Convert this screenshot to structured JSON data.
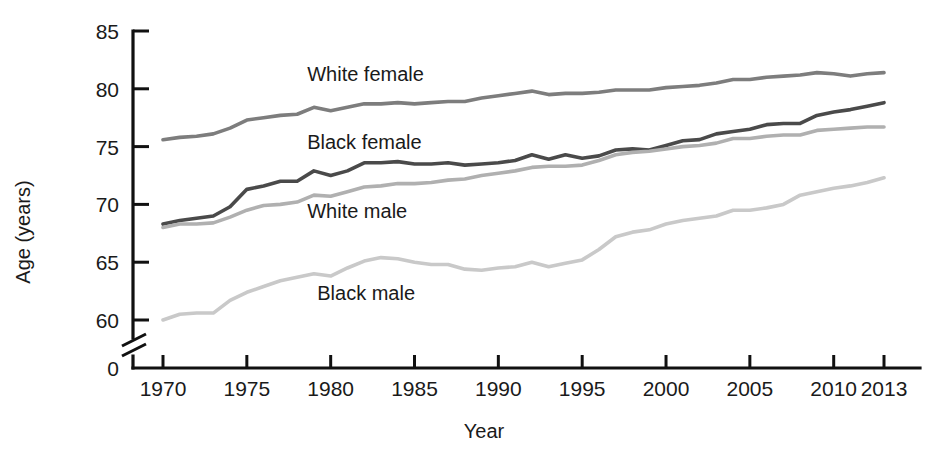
{
  "chart_data": {
    "type": "line",
    "title": "",
    "xlabel": "Year",
    "ylabel": "Age (years)",
    "xlim": [
      1968.5,
      2014.5
    ],
    "ylim": [
      59.0,
      85.0
    ],
    "y_axis_break": true,
    "y_break_from": 0,
    "y_break_to": 59,
    "grid": false,
    "legend": "inline-labels",
    "x_ticks": [
      "1970",
      "1975",
      "1980",
      "1985",
      "1990",
      "1995",
      "2000",
      "2005",
      "2010",
      "2013"
    ],
    "x_tick_values": [
      1970,
      1975,
      1980,
      1985,
      1990,
      1995,
      2000,
      2005,
      2010,
      2013
    ],
    "y_ticks": [
      "0",
      "60",
      "65",
      "70",
      "75",
      "80",
      "85"
    ],
    "y_tick_values": [
      0,
      60,
      65,
      70,
      75,
      80,
      85
    ],
    "x": [
      1970,
      1971,
      1972,
      1973,
      1974,
      1975,
      1976,
      1977,
      1978,
      1979,
      1980,
      1981,
      1982,
      1983,
      1984,
      1985,
      1986,
      1987,
      1988,
      1989,
      1990,
      1991,
      1992,
      1993,
      1994,
      1995,
      1996,
      1997,
      1998,
      1999,
      2000,
      2001,
      2002,
      2003,
      2004,
      2005,
      2006,
      2007,
      2008,
      2009,
      2010,
      2011,
      2012,
      2013
    ],
    "series": [
      {
        "name": "White female",
        "color": "#7d7d7d",
        "label": "White female",
        "values": [
          75.6,
          75.8,
          75.9,
          76.1,
          76.6,
          77.3,
          77.5,
          77.7,
          77.8,
          78.4,
          78.1,
          78.4,
          78.7,
          78.7,
          78.8,
          78.7,
          78.8,
          78.9,
          78.9,
          79.2,
          79.4,
          79.6,
          79.8,
          79.5,
          79.6,
          79.6,
          79.7,
          79.9,
          79.9,
          79.9,
          80.1,
          80.2,
          80.3,
          80.5,
          80.8,
          80.8,
          81.0,
          81.1,
          81.2,
          81.4,
          81.3,
          81.1,
          81.3,
          81.4
        ]
      },
      {
        "name": "Black female",
        "color": "#4a4a4a",
        "label": "Black female",
        "values": [
          68.3,
          68.6,
          68.8,
          69.0,
          69.8,
          71.3,
          71.6,
          72.0,
          72.0,
          72.9,
          72.5,
          72.9,
          73.6,
          73.6,
          73.7,
          73.5,
          73.5,
          73.6,
          73.4,
          73.5,
          73.6,
          73.8,
          74.3,
          73.9,
          74.3,
          74.0,
          74.2,
          74.7,
          74.8,
          74.7,
          75.1,
          75.5,
          75.6,
          76.1,
          76.3,
          76.5,
          76.9,
          77.0,
          77.0,
          77.7,
          78.0,
          78.2,
          78.5,
          78.8
        ]
      },
      {
        "name": "White male",
        "color": "#b0b0b0",
        "label": "White male",
        "values": [
          68.0,
          68.3,
          68.3,
          68.4,
          68.9,
          69.5,
          69.9,
          70.0,
          70.2,
          70.8,
          70.7,
          71.1,
          71.5,
          71.6,
          71.8,
          71.8,
          71.9,
          72.1,
          72.2,
          72.5,
          72.7,
          72.9,
          73.2,
          73.3,
          73.3,
          73.4,
          73.8,
          74.3,
          74.5,
          74.6,
          74.8,
          75.0,
          75.1,
          75.3,
          75.7,
          75.7,
          75.9,
          76.0,
          76.0,
          76.4,
          76.5,
          76.6,
          76.7,
          76.7
        ]
      },
      {
        "name": "Black male",
        "color": "#c9c9c9",
        "label": "Black male",
        "values": [
          60.0,
          60.5,
          60.6,
          60.6,
          61.7,
          62.4,
          62.9,
          63.4,
          63.7,
          64.0,
          63.8,
          64.5,
          65.1,
          65.4,
          65.3,
          65.0,
          64.8,
          64.8,
          64.4,
          64.3,
          64.5,
          64.6,
          65.0,
          64.6,
          64.9,
          65.2,
          66.1,
          67.2,
          67.6,
          67.8,
          68.3,
          68.6,
          68.8,
          69.0,
          69.5,
          69.5,
          69.7,
          70.0,
          70.8,
          71.1,
          71.4,
          71.6,
          71.9,
          72.3
        ]
      }
    ],
    "annotations": [
      {
        "text": "White female",
        "x": 1978.6,
        "y": 81.3
      },
      {
        "text": "Black female",
        "x": 1978.6,
        "y": 75.4
      },
      {
        "text": "White male",
        "x": 1978.6,
        "y": 69.4
      },
      {
        "text": "Black male",
        "x": 1979.2,
        "y": 62.3
      }
    ]
  }
}
